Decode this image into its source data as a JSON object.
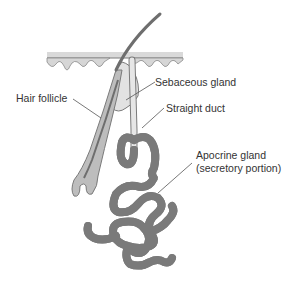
{
  "diagram": {
    "labels": {
      "hair_follicle": "Hair follicle",
      "sebaceous_gland": "Sebaceous gland",
      "straight_duct": "Straight duct",
      "apocrine_line1": "Apocrine gland",
      "apocrine_line2": "(secretory portion)"
    },
    "colors": {
      "outline": "#7a7a7a",
      "fill": "#e6e6e6",
      "skin_top": "#d9d9d9",
      "hair": "#6e6e6e",
      "text": "#333333",
      "leader": "#555555"
    }
  }
}
